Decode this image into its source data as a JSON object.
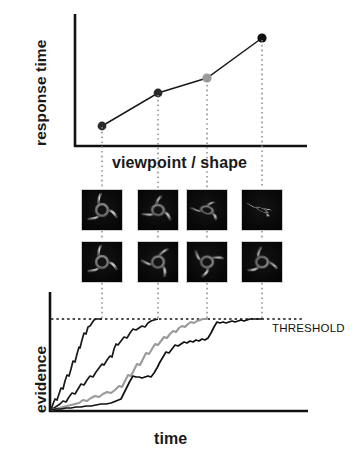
{
  "figure": {
    "background": "#ffffff",
    "ink": "#111111",
    "gray_series_color": "#9a9a9a",
    "dotted_connector_color": "#8c8c8c",
    "panels": [
      "response-time-panel",
      "stimulus-grid-panel",
      "evidence-accumulation-panel"
    ]
  },
  "top_panel": {
    "ylabel": "response time",
    "xlabel": "viewpoint / shape"
  },
  "bottom_panel": {
    "ylabel": "evidence",
    "xlabel": "time",
    "threshold_label": "THRESHOLD"
  },
  "stimuli": {
    "rows": [
      {
        "name": "stimulus-row-top",
        "cells": [
          {
            "name": "stimulus-top-1",
            "rotation": 0,
            "squash": 1.0,
            "tilt": 0
          },
          {
            "name": "stimulus-top-2",
            "rotation": 10,
            "squash": 0.86,
            "tilt": 6
          },
          {
            "name": "stimulus-top-3",
            "rotation": 22,
            "squash": 0.6,
            "tilt": 14
          },
          {
            "name": "stimulus-top-4",
            "rotation": 36,
            "squash": 0.26,
            "tilt": 24
          }
        ]
      },
      {
        "name": "stimulus-row-bottom",
        "cells": [
          {
            "name": "stimulus-bottom-1",
            "rotation": 0,
            "squash": 1.0,
            "tilt": 0
          },
          {
            "name": "stimulus-bottom-2",
            "rotation": 40,
            "squash": 0.95,
            "tilt": 0
          },
          {
            "name": "stimulus-bottom-3",
            "rotation": 80,
            "squash": 0.92,
            "tilt": 0
          },
          {
            "name": "stimulus-bottom-4",
            "rotation": 120,
            "squash": 0.9,
            "tilt": 0
          }
        ]
      }
    ]
  },
  "chart_data": [
    {
      "type": "line",
      "name": "response-time-vs-viewpoint",
      "title": "",
      "xlabel": "viewpoint / shape",
      "ylabel": "response time",
      "categories": [
        "1",
        "2",
        "3",
        "4"
      ],
      "x": [
        1,
        2,
        3,
        4
      ],
      "values": [
        0.18,
        0.52,
        0.74,
        0.9
      ],
      "xlim": [
        0.5,
        4.5
      ],
      "ylim": [
        0,
        1
      ],
      "grid": false,
      "legend": false,
      "marker_colors": [
        "#1a1a1a",
        "#1a1a1a",
        "#9a9a9a",
        "#111111"
      ],
      "axis_ticks_labeled": false,
      "annotation": "Monotonic increase of response time with viewpoint rotation / shape difficulty; dotted drop-lines connect each point to its stimulus image and to its evidence trace."
    },
    {
      "type": "line",
      "name": "evidence-accumulation",
      "title": "",
      "xlabel": "time",
      "ylabel": "evidence",
      "xlim": [
        0,
        1
      ],
      "ylim": [
        0,
        1.12
      ],
      "grid": false,
      "legend": false,
      "threshold": 1.0,
      "threshold_label": "THRESHOLD",
      "axis_ticks_labeled": false,
      "series": [
        {
          "name": "trace-1",
          "color": "#1a1a1a",
          "hit_threshold_at": 0.245,
          "comment": "fastest accumulation, steepest drift"
        },
        {
          "name": "trace-2",
          "color": "#1a1a1a",
          "hit_threshold_at": 0.448,
          "comment": "second fastest"
        },
        {
          "name": "trace-3",
          "color": "#9a9a9a",
          "hit_threshold_at": 0.632,
          "comment": "gray trace, slower drift"
        },
        {
          "name": "trace-4",
          "color": "#111111",
          "hit_threshold_at": 0.83,
          "comment": "slowest, most foreshortened viewpoint"
        }
      ],
      "annotation": "Noisy drift-diffusion style evidence accumulation; each trace rises from zero and terminates when it crosses the dotted THRESHOLD line."
    }
  ]
}
